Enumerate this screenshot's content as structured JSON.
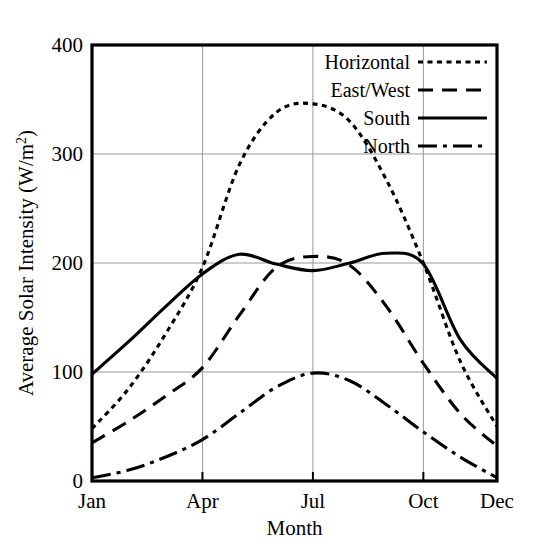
{
  "chart_data": {
    "type": "line",
    "title": "",
    "xlabel": "Month",
    "ylabel": "Average Solar Intensity (W/m2)",
    "ylabel_display": "Average Solar Intensity (W/m",
    "ylabel_sup": "2",
    "ylabel_tail": ")",
    "xlim": [
      1,
      12
    ],
    "ylim": [
      0,
      400
    ],
    "ytick_values": [
      0,
      100,
      200,
      300,
      400
    ],
    "ytick_labels": [
      "0",
      "100",
      "200",
      "300",
      "400"
    ],
    "xtick_positions": [
      1,
      4,
      7,
      10,
      12
    ],
    "xtick_labels": [
      "Jan",
      "Apr",
      "Jul",
      "Oct",
      "Dec"
    ],
    "grid": true,
    "grid_color": "#999999",
    "legend_position": "top-right",
    "x": [
      1,
      2,
      3,
      4,
      5,
      6,
      7,
      8,
      9,
      10,
      11,
      12
    ],
    "series": [
      {
        "name": "Horizontal",
        "style": "dotted",
        "values": [
          48,
          85,
          135,
          196,
          290,
          338,
          346,
          330,
          276,
          200,
          110,
          50
        ]
      },
      {
        "name": "East/West",
        "style": "dashed",
        "values": [
          35,
          55,
          78,
          104,
          152,
          196,
          206,
          198,
          160,
          108,
          62,
          32
        ]
      },
      {
        "name": "South",
        "style": "solid",
        "values": [
          98,
          128,
          160,
          190,
          208,
          199,
          193,
          200,
          209,
          199,
          130,
          94
        ]
      },
      {
        "name": "North",
        "style": "dashdot",
        "values": [
          3,
          10,
          22,
          38,
          62,
          86,
          99,
          92,
          70,
          45,
          22,
          3
        ]
      }
    ]
  },
  "legend": {
    "items": [
      {
        "label": "Horizontal",
        "style": "dotted"
      },
      {
        "label": "East/West",
        "style": "dashed"
      },
      {
        "label": "South",
        "style": "solid"
      },
      {
        "label": "North",
        "style": "dashdot"
      }
    ]
  }
}
